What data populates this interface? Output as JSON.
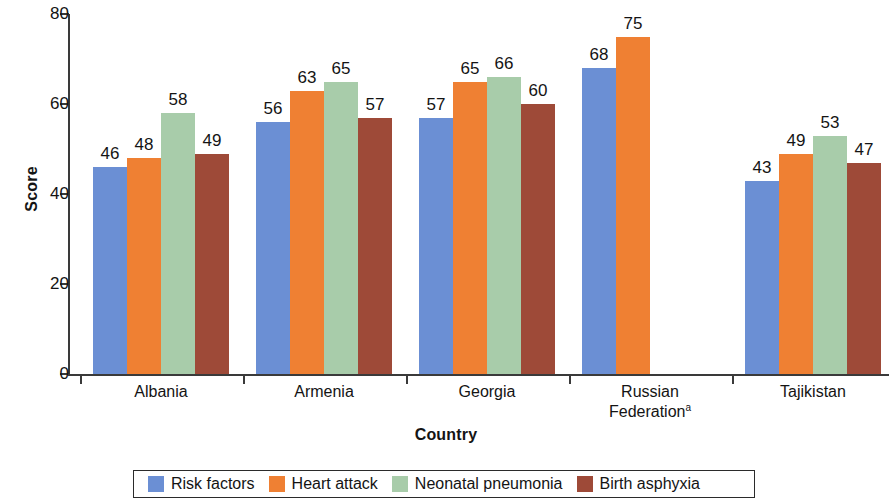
{
  "chart_data": {
    "type": "bar",
    "title": "",
    "xlabel": "Country",
    "ylabel": "Score",
    "categories": [
      "Albania",
      "Armenia",
      "Georgia",
      "Russian Federation",
      "Tajikistan"
    ],
    "category_footnotes": [
      "",
      "",
      "",
      "a",
      ""
    ],
    "series": [
      {
        "name": "Risk factors",
        "color": "#6b8fd4",
        "values": [
          46,
          56,
          57,
          68,
          43
        ]
      },
      {
        "name": "Heart attack",
        "color": "#ef8033",
        "values": [
          48,
          63,
          65,
          75,
          49
        ]
      },
      {
        "name": "Neonatal pneumonia",
        "color": "#a8ccaa",
        "values": [
          58,
          65,
          66,
          null,
          53
        ]
      },
      {
        "name": "Birth asphyxia",
        "color": "#9e4a38",
        "values": [
          49,
          57,
          60,
          null,
          47
        ]
      }
    ],
    "ylim": [
      0,
      80
    ],
    "yticks": [
      0,
      20,
      40,
      60,
      80
    ],
    "ytick_labels": [
      "0",
      "20",
      "40",
      "60",
      "80"
    ],
    "grid": false,
    "legend_position": "bottom",
    "bar_value_labels": true
  },
  "axis": {
    "y_title": "Score",
    "x_title": "Country"
  },
  "legend": {
    "items": [
      {
        "label": "Risk factors",
        "color": "#6b8fd4"
      },
      {
        "label": "Heart attack",
        "color": "#ef8033"
      },
      {
        "label": "Neonatal pneumonia",
        "color": "#a8ccaa"
      },
      {
        "label": "Birth asphyxia",
        "color": "#9e4a38"
      }
    ]
  }
}
